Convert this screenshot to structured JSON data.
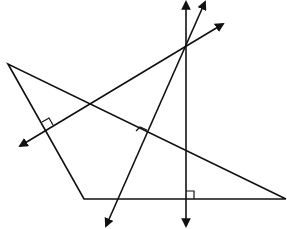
{
  "diagram": {
    "triangle": {
      "vertices": [
        [
          8,
          64
        ],
        [
          84,
          199
        ],
        [
          286,
          199
        ]
      ]
    },
    "bisectors": [
      {
        "name": "bisector-bottom",
        "from": [
          186,
          227
        ],
        "to": [
          186,
          1
        ],
        "right_angle_at": [
          186,
          199
        ]
      },
      {
        "name": "bisector-left",
        "from": [
          20,
          146
        ],
        "to": [
          223,
          24
        ],
        "right_angle_at": [
          46,
          125
        ]
      },
      {
        "name": "bisector-long",
        "from": [
          106,
          227
        ],
        "to": [
          205,
          1
        ],
        "right_angle_at": [
          146,
          132
        ]
      }
    ],
    "circumcenter": [
      186,
      47
    ],
    "colors": {
      "stroke": "#111111",
      "background": "#ffffff"
    }
  }
}
